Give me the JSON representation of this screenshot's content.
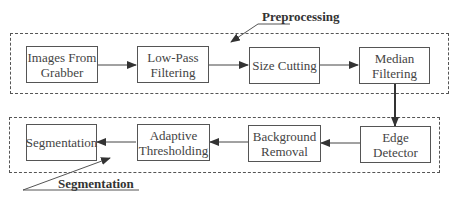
{
  "diagram": {
    "groups": {
      "preprocessing": {
        "label": "Preprocessing"
      },
      "segmentation": {
        "label": "Segmentation"
      }
    },
    "nodes": {
      "images_from_grabber": "Images From Grabber",
      "low_pass_filtering": "Low-Pass Filtering",
      "size_cutting": "Size Cutting",
      "median_filtering": "Median Filtering",
      "edge_detector": "Edge Detector",
      "background_removal": "Background Removal",
      "adaptive_thresholding": "Adaptive Thresholding",
      "segmentation": "Segmentation"
    },
    "edges": [
      [
        "Images From Grabber",
        "Low-Pass Filtering"
      ],
      [
        "Low-Pass Filtering",
        "Size Cutting"
      ],
      [
        "Size Cutting",
        "Median Filtering"
      ],
      [
        "Median Filtering",
        "Edge Detector"
      ],
      [
        "Edge Detector",
        "Background Removal"
      ],
      [
        "Background Removal",
        "Adaptive Thresholding"
      ],
      [
        "Adaptive Thresholding",
        "Segmentation"
      ]
    ]
  }
}
